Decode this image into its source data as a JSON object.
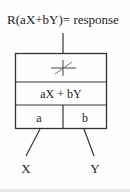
{
  "diagram": {
    "title": "R(aX+bY)= response",
    "activation_symbol": "crossed-lines",
    "sum_label": "aX + bY",
    "weights": [
      "a",
      "b"
    ],
    "inputs": [
      "X",
      "Y"
    ],
    "colors": {
      "stroke": "#333333",
      "text": "#222222",
      "background": "#fefefe"
    }
  }
}
